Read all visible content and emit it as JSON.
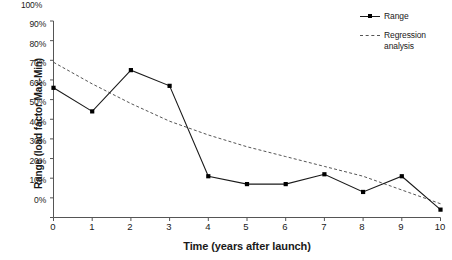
{
  "chart_data": {
    "type": "line",
    "title": "",
    "xlabel": "Time (years after launch)",
    "ylabel": "Range (load factor Max-Min)",
    "xlim": [
      0,
      10
    ],
    "ylim": [
      0,
      100
    ],
    "grid": false,
    "legend_position": "top-right",
    "x": [
      0,
      1,
      2,
      3,
      4,
      5,
      6,
      7,
      8,
      9,
      10
    ],
    "xticklabels": [
      "0",
      "1",
      "2",
      "3",
      "4",
      "5",
      "6",
      "7",
      "8",
      "9",
      "10"
    ],
    "yticks": [
      0,
      10,
      20,
      30,
      40,
      50,
      60,
      70,
      80,
      90,
      100
    ],
    "yticklabels": [
      "0%",
      "10%",
      "20%",
      "30%",
      "40%",
      "50%",
      "60%",
      "70%",
      "80%",
      "90%",
      "100%"
    ],
    "series": [
      {
        "name": "Range",
        "style": "solid-with-square-markers",
        "color": "#1a1a1a",
        "values": [
          66,
          54,
          75,
          67,
          21,
          17,
          17,
          22,
          13,
          21,
          4
        ]
      },
      {
        "name": "Regression analysis",
        "style": "dashed",
        "color": "#555555",
        "values": [
          79,
          68,
          58,
          49,
          42,
          36,
          31,
          26,
          21,
          14,
          7
        ]
      }
    ]
  },
  "legend": {
    "items": [
      {
        "label": "Range"
      },
      {
        "label": "Regression analysis"
      }
    ]
  }
}
